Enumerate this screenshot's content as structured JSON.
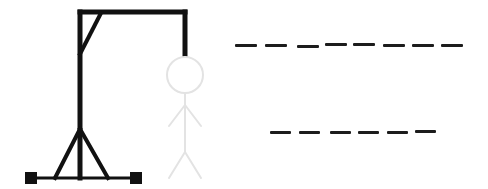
{
  "game": {
    "title": "Hangman",
    "colors": {
      "gallows": "#111111",
      "figure": "#e3e3e3",
      "slot": "#1c1c1c",
      "background": "#ffffff"
    },
    "figure_parts": [
      "head",
      "body",
      "left-arm",
      "right-arm",
      "left-leg",
      "right-leg"
    ],
    "words": [
      {
        "row": 1,
        "length": 8,
        "letters": [
          "",
          "",
          "",
          "",
          "",
          "",
          "",
          ""
        ],
        "slots_x": [
          235,
          265,
          297,
          325,
          353,
          383,
          412,
          441
        ],
        "slot_width": 22,
        "y": 45
      },
      {
        "row": 2,
        "length": 6,
        "letters": [
          "",
          "",
          "",
          "",
          "",
          ""
        ],
        "slots_x": [
          270,
          299,
          330,
          358,
          387,
          415
        ],
        "slot_width": 21,
        "y": 131
      }
    ]
  }
}
